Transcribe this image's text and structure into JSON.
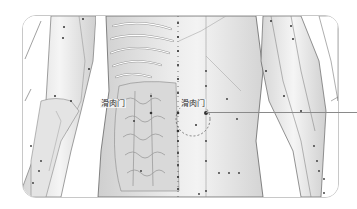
{
  "figure": {
    "labels": [
      {
        "id": "left",
        "text": "滑肉门"
      },
      {
        "id": "right",
        "text": "滑肉门"
      }
    ],
    "highlight_point": "滑肉门",
    "colors": {
      "background": "#ffffff",
      "frame_border": "#c8c8c8",
      "skin_light": "#f2f2f2",
      "skin_shade": "#cfcfcf",
      "outline": "#6e6e6e",
      "point": "#333333",
      "leader_line": "#8a8a8a"
    }
  }
}
